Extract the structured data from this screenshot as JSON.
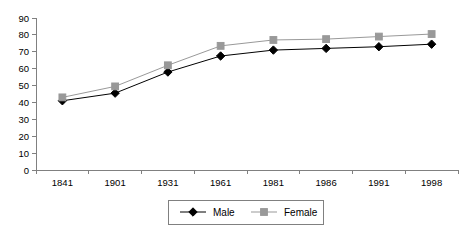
{
  "chart_data": {
    "type": "line",
    "title": "",
    "subtitle": "",
    "xlabel": "",
    "ylabel": "",
    "categories": [
      "1841",
      "1901",
      "1931",
      "1961",
      "1981",
      "1986",
      "1991",
      "1998"
    ],
    "ylim": [
      0,
      90
    ],
    "ytick_step": 10,
    "yticks": [
      "0",
      "10",
      "20",
      "30",
      "40",
      "50",
      "60",
      "70",
      "80",
      "90"
    ],
    "grid": false,
    "legend_position": "bottom-center",
    "series": [
      {
        "name": "Male",
        "color": "#000000",
        "marker": "diamond",
        "values": [
          41,
          45.5,
          58,
          67.5,
          71,
          72,
          73,
          74.5
        ]
      },
      {
        "name": "Female",
        "color": "#999999",
        "marker": "square",
        "values": [
          43,
          49.5,
          62,
          73.5,
          77,
          77.5,
          79,
          80.5
        ]
      }
    ]
  },
  "legend": {
    "entries": [
      {
        "label": "Male"
      },
      {
        "label": "Female"
      }
    ]
  },
  "colors": {
    "male": "#000000",
    "female": "#999999",
    "axis": "#808080",
    "background": "#ffffff"
  }
}
